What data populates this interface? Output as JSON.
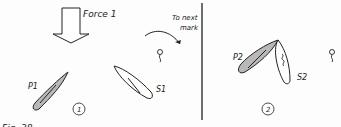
{
  "diagram": {
    "force_label": "Force 1",
    "next_mark_label_line1": "To next",
    "next_mark_label_line2": "mark",
    "panels": [
      {
        "number": "1",
        "boats": [
          {
            "label": "P1",
            "fill": "#b8b8b8"
          },
          {
            "label": "S1",
            "fill": "#ffffff"
          }
        ]
      },
      {
        "number": "2",
        "boats": [
          {
            "label": "P2",
            "fill": "#b8b8b8"
          },
          {
            "label": "S2",
            "fill": "#ffffff"
          }
        ]
      }
    ],
    "cut_off_caption": "Fig. 38"
  }
}
